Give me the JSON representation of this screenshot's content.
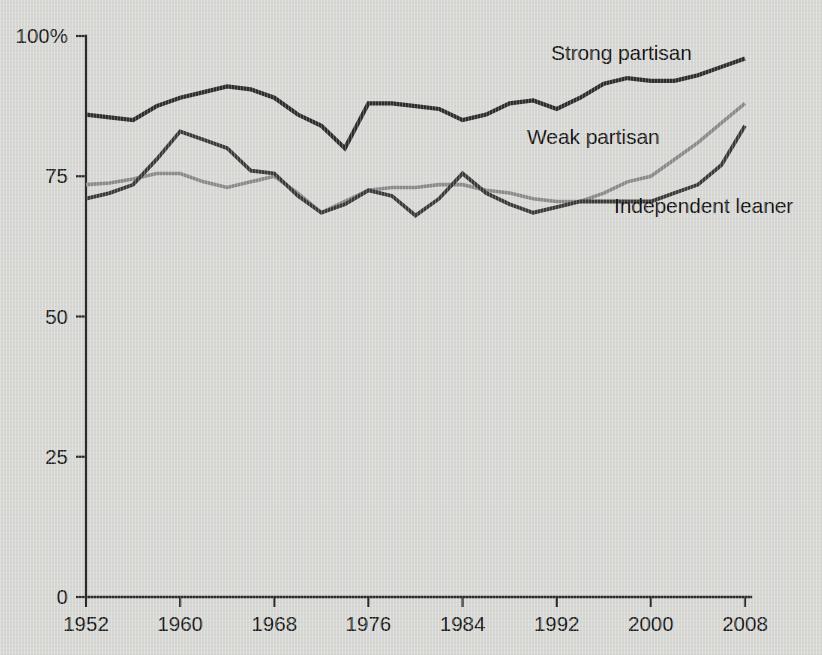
{
  "chart_data": {
    "type": "line",
    "title": "",
    "subtitle": "",
    "xlabel": "",
    "ylabel": "",
    "xlim": [
      1952,
      2008
    ],
    "ylim": [
      0,
      100
    ],
    "grid": false,
    "legend_position": "inline-annotations",
    "x": [
      1952,
      1954,
      1956,
      1958,
      1960,
      1962,
      1964,
      1966,
      1968,
      1970,
      1972,
      1974,
      1976,
      1978,
      1980,
      1982,
      1984,
      1986,
      1988,
      1990,
      1992,
      1994,
      1996,
      1998,
      2000,
      2002,
      2004,
      2006,
      2008
    ],
    "x_ticks": [
      1952,
      1960,
      1968,
      1976,
      1984,
      1992,
      2000,
      2008
    ],
    "x_tick_labels": [
      "1952",
      "1960",
      "1968",
      "1976",
      "1984",
      "1992",
      "2000",
      "2008"
    ],
    "y_ticks": [
      0,
      25,
      50,
      75,
      100
    ],
    "y_tick_labels": [
      "0",
      "25",
      "50",
      "75",
      "100%"
    ],
    "series": [
      {
        "name": "Strong partisan",
        "color": "#2d2d2d",
        "label_x": 1990,
        "label_y": 99,
        "values": [
          86,
          85.5,
          85,
          87.5,
          89,
          90,
          91,
          90.5,
          89,
          86,
          84,
          80,
          88,
          88,
          87.5,
          87,
          85,
          86,
          88,
          88.5,
          87,
          89,
          91.5,
          92.5,
          92,
          92,
          93,
          94.5,
          96
        ]
      },
      {
        "name": "Weak partisan",
        "color": "#8a8a8a",
        "label_x": 1986,
        "label_y": 86,
        "values": [
          73.5,
          73.8,
          74.5,
          75.5,
          75.5,
          74,
          73,
          74,
          75,
          72,
          68.5,
          70.5,
          72.5,
          73,
          73,
          73.5,
          73.5,
          72.5,
          72,
          71,
          70.5,
          70.5,
          72,
          74,
          75,
          78,
          81,
          84.5,
          88
        ]
      },
      {
        "name": "Independent leaner",
        "color": "#3a3a3a",
        "label_x": 1998,
        "label_y": 69,
        "values": [
          71,
          72,
          73.5,
          78,
          83,
          81.5,
          80,
          76,
          75.5,
          71.5,
          68.5,
          70,
          72.5,
          71.5,
          68,
          71,
          75.5,
          72,
          70,
          68.5,
          69.5,
          70.5,
          70.5,
          70.5,
          70.5,
          72,
          73.5,
          77,
          84
        ]
      }
    ]
  },
  "labels": {
    "strong_partisan": "Strong partisan",
    "weak_partisan": "Weak partisan",
    "independent_leaner": "Independent leaner"
  }
}
